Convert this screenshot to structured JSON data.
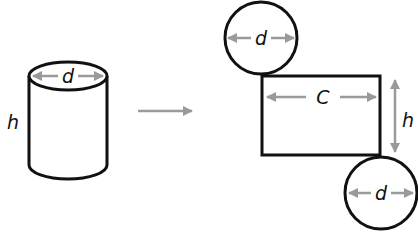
{
  "diagram": {
    "colors": {
      "stroke": "#111111",
      "dimension": "#9a9a9a",
      "background": "#ffffff"
    },
    "cylinder": {
      "labels": {
        "diameter": "d",
        "height": "h"
      }
    },
    "transform_arrow": {
      "direction": "right"
    },
    "net": {
      "top_circle": {
        "label": "d"
      },
      "rectangle": {
        "width_label": "C",
        "height_label": "h"
      },
      "bottom_circle": {
        "label": "d"
      }
    }
  }
}
